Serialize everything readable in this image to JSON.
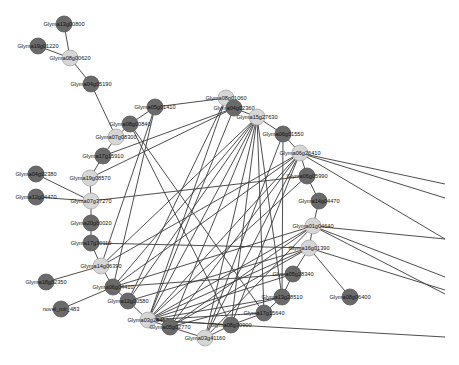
{
  "colors": {
    "background": "#ffffff",
    "edge": "#3a3a3a",
    "node_dark": "#6a6a6a",
    "node_light": "#d6d6d6"
  },
  "nodes": [
    {
      "id": "n1",
      "label": "Glyma13g00800",
      "x": 64,
      "y": 24,
      "shade": "dark"
    },
    {
      "id": "n2",
      "label": "Glyma19g01220",
      "x": 38,
      "y": 46,
      "shade": "dark"
    },
    {
      "id": "n3",
      "label": "Glyma08g00620",
      "x": 70,
      "y": 58,
      "shade": "light"
    },
    {
      "id": "n4",
      "label": "Glyma04g05190",
      "x": 91,
      "y": 84,
      "shade": "dark"
    },
    {
      "id": "n5",
      "label": "Glyma08g01060",
      "x": 226,
      "y": 98,
      "shade": "light"
    },
    {
      "id": "n6",
      "label": "Glyma05g01410",
      "x": 155,
      "y": 107,
      "shade": "dark"
    },
    {
      "id": "n7",
      "label": "Glyma04g02360",
      "x": 234,
      "y": 108,
      "shade": "dark"
    },
    {
      "id": "n8",
      "label": "Glyma15g27630",
      "x": 257,
      "y": 117,
      "shade": "light"
    },
    {
      "id": "n9",
      "label": "Glyma06g01550",
      "x": 283,
      "y": 134,
      "shade": "dark"
    },
    {
      "id": "n10",
      "label": "Glyma08g00840",
      "x": 130,
      "y": 124,
      "shade": "dark"
    },
    {
      "id": "n11",
      "label": "Glyma07g08300",
      "x": 116,
      "y": 137,
      "shade": "light"
    },
    {
      "id": "n12",
      "label": "Glyma17g15910",
      "x": 103,
      "y": 156,
      "shade": "dark"
    },
    {
      "id": "n13",
      "label": "Glyma06g26410",
      "x": 300,
      "y": 153,
      "shade": "light"
    },
    {
      "id": "n14",
      "label": "Glyma06g05990",
      "x": 307,
      "y": 176,
      "shade": "dark"
    },
    {
      "id": "n15",
      "label": "Glyma19g08570",
      "x": 90,
      "y": 178,
      "shade": "light"
    },
    {
      "id": "n16",
      "label": "Glyma04g02380",
      "x": 36,
      "y": 174,
      "shade": "dark"
    },
    {
      "id": "n17",
      "label": "Glyma12g04470",
      "x": 36,
      "y": 197,
      "shade": "dark"
    },
    {
      "id": "n18",
      "label": "Glyma07g37270",
      "x": 91,
      "y": 201,
      "shade": "light"
    },
    {
      "id": "n19",
      "label": "Glyma14g04470",
      "x": 319,
      "y": 201,
      "shade": "dark"
    },
    {
      "id": "n20",
      "label": "Glyma20g00020",
      "x": 91,
      "y": 223,
      "shade": "dark"
    },
    {
      "id": "n21",
      "label": "Glyma01g04640",
      "x": 313,
      "y": 226,
      "shade": "light"
    },
    {
      "id": "n22",
      "label": "Glyma17g30110",
      "x": 91,
      "y": 243,
      "shade": "dark"
    },
    {
      "id": "n23",
      "label": "Glyma16g01390",
      "x": 309,
      "y": 248,
      "shade": "light"
    },
    {
      "id": "n24",
      "label": "Glyma14g06390",
      "x": 101,
      "y": 266,
      "shade": "light"
    },
    {
      "id": "n25",
      "label": "Glyma18g02350",
      "x": 46,
      "y": 282,
      "shade": "dark"
    },
    {
      "id": "n26",
      "label": "Glyma06g04410",
      "x": 113,
      "y": 287,
      "shade": "dark"
    },
    {
      "id": "n27",
      "label": "Glyma05g28340",
      "x": 293,
      "y": 274,
      "shade": "dark"
    },
    {
      "id": "n28",
      "label": "Glyma13g28510",
      "x": 282,
      "y": 297,
      "shade": "dark"
    },
    {
      "id": "n29",
      "label": "Glyma08g06400",
      "x": 350,
      "y": 297,
      "shade": "dark"
    },
    {
      "id": "n30",
      "label": "novel_mir_483",
      "x": 61,
      "y": 309,
      "shade": "dark"
    },
    {
      "id": "n31",
      "label": "Glyma12g00580",
      "x": 128,
      "y": 301,
      "shade": "dark"
    },
    {
      "id": "n32",
      "label": "Glyma17g15640",
      "x": 264,
      "y": 313,
      "shade": "dark"
    },
    {
      "id": "n33",
      "label": "Glyma03g28450",
      "x": 148,
      "y": 320,
      "shade": "light"
    },
    {
      "id": "n34",
      "label": "Glyma08g30900",
      "x": 231,
      "y": 325,
      "shade": "dark"
    },
    {
      "id": "n35",
      "label": "Glyma05g02770",
      "x": 170,
      "y": 327,
      "shade": "dark"
    },
    {
      "id": "n36",
      "label": "Glyma03g41160",
      "x": 205,
      "y": 338,
      "shade": "light"
    }
  ],
  "edges": [
    [
      "n1",
      "n3"
    ],
    [
      "n2",
      "n3"
    ],
    [
      "n3",
      "n4"
    ],
    [
      "n4",
      "n11"
    ],
    [
      "n11",
      "n10"
    ],
    [
      "n11",
      "n12"
    ],
    [
      "n12",
      "n15"
    ],
    [
      "n15",
      "n18"
    ],
    [
      "n16",
      "n18"
    ],
    [
      "n17",
      "n18"
    ],
    [
      "n18",
      "n20"
    ],
    [
      "n20",
      "n22"
    ],
    [
      "n22",
      "n24"
    ],
    [
      "n24",
      "n26"
    ],
    [
      "n25",
      "n24"
    ],
    [
      "n30",
      "n26"
    ],
    [
      "n26",
      "n31"
    ],
    [
      "n31",
      "n33"
    ],
    [
      "n33",
      "n35"
    ],
    [
      "n35",
      "n36"
    ],
    [
      "n36",
      "n34"
    ],
    [
      "n34",
      "n32"
    ],
    [
      "n32",
      "n28"
    ],
    [
      "n28",
      "n27"
    ],
    [
      "n27",
      "n23"
    ],
    [
      "n23",
      "n21"
    ],
    [
      "n21",
      "n19"
    ],
    [
      "n19",
      "n14"
    ],
    [
      "n14",
      "n13"
    ],
    [
      "n13",
      "n9"
    ],
    [
      "n9",
      "n8"
    ],
    [
      "n8",
      "n7"
    ],
    [
      "n7",
      "n5"
    ],
    [
      "n5",
      "n6"
    ],
    [
      "n6",
      "n10"
    ],
    [
      "n23",
      "n29"
    ],
    [
      "n5",
      "n33"
    ],
    [
      "n5",
      "n31"
    ],
    [
      "n6",
      "n26"
    ],
    [
      "n6",
      "n24"
    ],
    [
      "n7",
      "n15"
    ],
    [
      "n7",
      "n12"
    ],
    [
      "n7",
      "n33"
    ],
    [
      "n8",
      "n24"
    ],
    [
      "n8",
      "n26"
    ],
    [
      "n8",
      "n31"
    ],
    [
      "n8",
      "n33"
    ],
    [
      "n8",
      "n35"
    ],
    [
      "n8",
      "n36"
    ],
    [
      "n8",
      "n34"
    ],
    [
      "n8",
      "n32"
    ],
    [
      "n8",
      "n28"
    ],
    [
      "n13",
      "n24"
    ],
    [
      "n13",
      "n26"
    ],
    [
      "n13",
      "n33"
    ],
    [
      "n13",
      "n35"
    ],
    [
      "n13",
      "n36"
    ],
    [
      "n13",
      "n34"
    ],
    [
      "n21",
      "n33"
    ],
    [
      "n21",
      "n26"
    ],
    [
      "n21",
      "n35"
    ],
    [
      "n21",
      "n36"
    ],
    [
      "n23",
      "n33"
    ],
    [
      "n23",
      "n31"
    ],
    [
      "n23",
      "n35"
    ],
    [
      "n23",
      "n22"
    ],
    [
      "n14",
      "n33"
    ],
    [
      "n14",
      "n18"
    ],
    [
      "n10",
      "n34"
    ],
    [
      "n10",
      "n32"
    ],
    [
      "n9",
      "n36"
    ],
    [
      "n9",
      "n28"
    ],
    [
      "n27",
      "n33"
    ],
    [
      "n28",
      "n33"
    ],
    [
      "n32",
      "n33"
    ],
    [
      "n34",
      "n33"
    ],
    [
      "n27",
      "n26"
    ],
    [
      "n28",
      "n35"
    ]
  ],
  "offscreen_edges": [
    {
      "from": "n13",
      "to_x": 445,
      "to_y": 184
    },
    {
      "from": "n13",
      "to_x": 445,
      "to_y": 198
    },
    {
      "from": "n13",
      "to_x": 445,
      "to_y": 239
    },
    {
      "from": "n21",
      "to_x": 445,
      "to_y": 239
    },
    {
      "from": "n21",
      "to_x": 445,
      "to_y": 277
    },
    {
      "from": "n23",
      "to_x": 445,
      "to_y": 290
    },
    {
      "from": "n21",
      "to_x": 445,
      "to_y": 294
    },
    {
      "from": "n33",
      "to_x": 445,
      "to_y": 337
    }
  ]
}
